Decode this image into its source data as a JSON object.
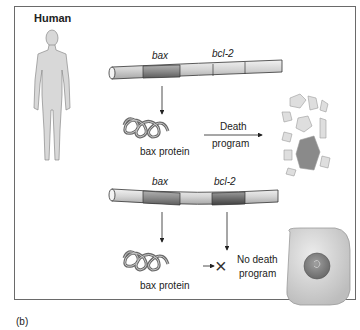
{
  "figure": {
    "panel_label": "(b)",
    "organism_label": "Human"
  },
  "top_scenario": {
    "gene_labels": [
      "bax",
      "bcl-2"
    ],
    "protein_label": "bax protein",
    "outcome_label_line1": "Death",
    "outcome_label_line2": "program",
    "outcome_image": "fragmented-apoptotic-cell"
  },
  "bottom_scenario": {
    "gene_labels": [
      "bax",
      "bcl-2"
    ],
    "protein_label": "bax protein",
    "outcome_label_line1": "No death",
    "outcome_label_line2": "program",
    "block_symbol": "×",
    "outcome_image": "healthy-cell"
  },
  "colors": {
    "frame": "#6a6a6a",
    "dna_light": "#d9d9d9",
    "dna_bax": "#8f8f8f",
    "dna_bcl2_expressed": "#6e6e6e",
    "protein": "#9a9a9a",
    "cell": "#d6d6d6",
    "nucleus": "#8a8a8a"
  }
}
